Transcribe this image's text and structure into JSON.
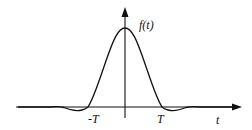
{
  "figure": {
    "function_label": "f(t)",
    "x_axis_label": "t",
    "ticks": [
      {
        "label": "-T",
        "t": -1
      },
      {
        "label": "T",
        "t": 1
      }
    ]
  },
  "colors": {
    "stroke": "#111111",
    "background": "#ffffff"
  }
}
